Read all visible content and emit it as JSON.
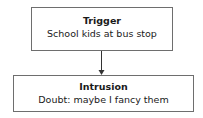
{
  "nodes": [
    {
      "id": "trigger",
      "title": "Trigger",
      "text": "School kids at bus stop"
    },
    {
      "id": "intrusion",
      "title": "Intrusion",
      "text": "Doubt: maybe I fancy them"
    }
  ],
  "edges": [
    {
      "from": "trigger",
      "to": "intrusion"
    }
  ],
  "colors": {
    "border": "#6e6e6e",
    "arrow": "#333333",
    "text": "#1a1a1a"
  }
}
